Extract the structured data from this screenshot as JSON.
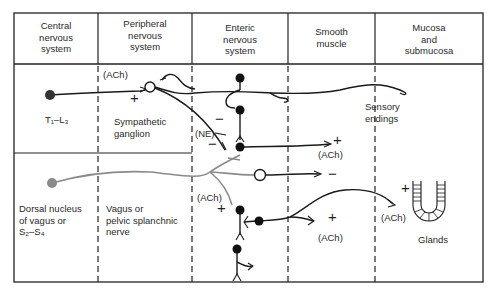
{
  "headers": [
    {
      "line1": "Central",
      "line2": "nervous",
      "line3": "system"
    },
    {
      "line1": "Peripheral",
      "line2": "nervous",
      "line3": "system"
    },
    {
      "line1": "Enteric",
      "line2": "nervous",
      "line3": "system"
    },
    {
      "line1": "Smooth",
      "line2": "muscle",
      "line3": ""
    },
    {
      "line1": "Mucosa",
      "line2": "and",
      "line3": "submucosa"
    }
  ],
  "sympathetic": {
    "origin": "T₁–L₃",
    "ganglion_line1": "Sympathetic",
    "ganglion_line2": "ganglion",
    "preganglionic_transmitter": "(ACh)",
    "postganglionic_transmitter": "(NE)"
  },
  "parasympathetic": {
    "origin_line1": "Dorsal nucleus",
    "origin_line2": "of vagus or",
    "origin_line3": "S₂–S₄",
    "nerve_line1": "Vagus or",
    "nerve_line2": "pelvic splanchnic",
    "nerve_line3": "nerve",
    "transmitter": "(ACh)"
  },
  "labels": {
    "sensory_line1": "Sensory",
    "sensory_line2": "endings",
    "glands": "Glands",
    "ach_muscle_1": "(ACh)",
    "ach_muscle_2": "(ACh)",
    "ach_glands": "(ACh)"
  },
  "signs": {
    "plus": "+",
    "minus": "−"
  },
  "colors": {
    "line": "#1a1a1a",
    "parasympathetic": "#8a8a8a"
  }
}
